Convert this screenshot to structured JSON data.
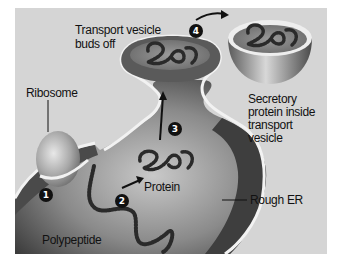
{
  "diagram": {
    "labels": {
      "ribosome": "Ribosome",
      "transport_vesicle_buds_off_line1": "Transport vesicle",
      "transport_vesicle_buds_off_line2": "buds off",
      "secretory_line1": "Secretory",
      "secretory_line2": "protein inside",
      "secretory_line3": "transport",
      "secretory_line4": "vesicle",
      "protein": "Protein",
      "rough_er": "Rough ER",
      "polypeptide": "Polypeptide"
    },
    "steps": [
      {
        "number": "1",
        "meaning": "Polypeptide enters rough ER from ribosome"
      },
      {
        "number": "2",
        "meaning": "Polypeptide folds into protein"
      },
      {
        "number": "3",
        "meaning": "Protein moves into budding vesicle"
      },
      {
        "number": "4",
        "meaning": "Transport vesicle carries secretory protein away"
      }
    ],
    "colors": {
      "background": "#d5d5d5",
      "er_dark": "#3a3a3a",
      "er_light": "#b8b8b8",
      "membrane": "#f0f0f0",
      "chain": "#2a2a2a",
      "badge": "#111111"
    }
  }
}
